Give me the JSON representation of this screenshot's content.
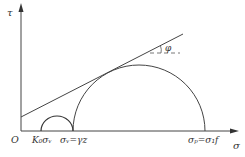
{
  "diagram": {
    "axes": {
      "y_label": "τ",
      "x_label": "σ",
      "origin_label": "O"
    },
    "labels": {
      "k0_sigma_v": "K₀σᵥ",
      "sigma_v_gamma_z": "σᵥ=γz",
      "sigma_p_sigma_1f": "σₚ=σ₁f",
      "phi": "φ"
    },
    "colors": {
      "stroke": "#444444",
      "text": "#333333",
      "background": "#ffffff"
    }
  }
}
